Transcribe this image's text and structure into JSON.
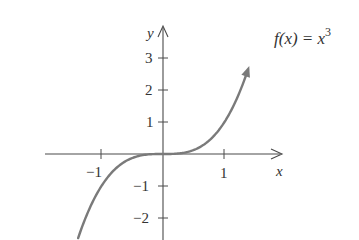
{
  "chart_data": {
    "type": "line",
    "xlabel": "x",
    "ylabel": "y",
    "xlim": [
      -1.7,
      1.7
    ],
    "ylim": [
      -2.6,
      3.4
    ],
    "grid": false,
    "x_ticks": [
      -1,
      1
    ],
    "y_ticks": [
      -2,
      -1,
      1,
      2,
      3
    ],
    "x_tick_labels": [
      "−1",
      "1"
    ],
    "y_tick_labels": [
      "−2",
      "−1",
      "1",
      "2",
      "3"
    ],
    "series": [
      {
        "name": "f(x) = x^3",
        "color": "#7a7a7a",
        "x": [
          -1.4,
          -1.2,
          -1.0,
          -0.8,
          -0.6,
          -0.4,
          -0.2,
          0,
          0.2,
          0.4,
          0.6,
          0.8,
          1.0,
          1.2,
          1.4
        ],
        "y": [
          -2.744,
          -1.728,
          -1.0,
          -0.512,
          -0.216,
          -0.064,
          -0.008,
          0,
          0.008,
          0.064,
          0.216,
          0.512,
          1.0,
          1.728,
          2.744
        ]
      }
    ],
    "annotations": [
      {
        "text": "f(x) = x",
        "superscript": "3",
        "position": "upper right"
      }
    ]
  },
  "labels": {
    "x_axis": "x",
    "y_axis": "y",
    "func_prefix": "f(x) = x",
    "func_exp": "3",
    "tick_x_neg1": "−1",
    "tick_x_1": "1",
    "tick_y_3": "3",
    "tick_y_2": "2",
    "tick_y_1": "1",
    "tick_y_neg1": "−1",
    "tick_y_neg2": "−2"
  }
}
